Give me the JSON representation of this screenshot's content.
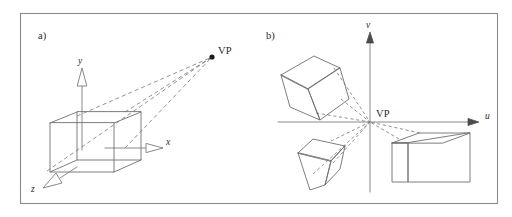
{
  "figure": {
    "background_color": "#ffffff",
    "frame_color": "#8b8b8b",
    "line_color": "#6f6f74",
    "dashed_color": "#7e7e86",
    "text_color": "#2a2a2a",
    "width": 512,
    "height": 217
  },
  "panel_a": {
    "label": "a)",
    "vanishing_point_label": "VP",
    "axes": [
      {
        "name": "y-axis",
        "label": "y"
      },
      {
        "name": "x-axis",
        "label": "x"
      },
      {
        "name": "z-axis",
        "label": "z"
      }
    ],
    "objects": [
      {
        "name": "box",
        "kind": "wireframe-box",
        "count": 1
      }
    ],
    "ray_count": 4,
    "description_kind": "one-point perspective of a box in world coordinates converging to VP"
  },
  "panel_b": {
    "label": "b)",
    "vanishing_point_label": "VP",
    "axes": [
      {
        "name": "v-axis",
        "label": "v"
      },
      {
        "name": "u-axis",
        "label": "u"
      }
    ],
    "objects": [
      {
        "name": "box-upper-left",
        "kind": "wireframe-box"
      },
      {
        "name": "box-lower-left",
        "kind": "wireframe-box"
      },
      {
        "name": "box-lower-right",
        "kind": "wireframe-box"
      }
    ],
    "ray_count": 8,
    "description_kind": "image plane u-v with three boxes whose receding edges converge at VP"
  }
}
